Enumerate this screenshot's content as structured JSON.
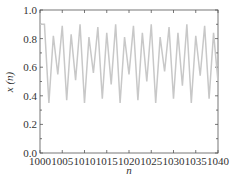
{
  "chart_data": {
    "type": "line",
    "title": "",
    "xlabel": "n",
    "ylabel": "x (n)",
    "xlim": [
      1000,
      1040
    ],
    "ylim": [
      0.0,
      1.0
    ],
    "grid": false,
    "legend": null,
    "x_ticks": [
      "1000",
      "1005",
      "1010",
      "1015",
      "1020",
      "1025",
      "1030",
      "1035",
      "1040"
    ],
    "y_ticks": [
      "0.0",
      "0.2",
      "0.4",
      "0.6",
      "0.8",
      "1.0"
    ],
    "line_color": "#c8c8c8",
    "x": [
      1000,
      1001,
      1002,
      1003,
      1004,
      1005,
      1006,
      1007,
      1008,
      1009,
      1010,
      1011,
      1012,
      1013,
      1014,
      1015,
      1016,
      1017,
      1018,
      1019,
      1020,
      1021,
      1022,
      1023,
      1024,
      1025,
      1026,
      1027,
      1028,
      1029,
      1030,
      1031,
      1032,
      1033,
      1034,
      1035,
      1036,
      1037,
      1038,
      1039,
      1040
    ],
    "series": [
      {
        "name": "x(n)",
        "values": [
          0.9,
          0.9,
          0.35,
          0.82,
          0.55,
          0.89,
          0.37,
          0.83,
          0.51,
          0.9,
          0.35,
          0.81,
          0.56,
          0.88,
          0.38,
          0.84,
          0.48,
          0.9,
          0.35,
          0.81,
          0.55,
          0.89,
          0.37,
          0.84,
          0.5,
          0.9,
          0.35,
          0.81,
          0.57,
          0.88,
          0.38,
          0.84,
          0.47,
          0.9,
          0.35,
          0.82,
          0.54,
          0.89,
          0.38,
          0.84,
          0.5
        ]
      }
    ]
  }
}
